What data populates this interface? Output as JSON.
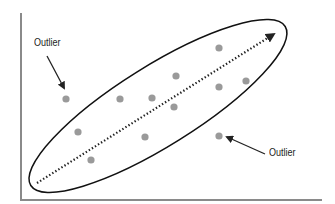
{
  "chart_data": {
    "type": "scatter",
    "title": "",
    "xlabel": "",
    "ylabel": "",
    "grid": false,
    "legend": null,
    "colors": {
      "points": "#9a9a9a",
      "axes": "#8a8a8a",
      "ellipse": "#111111",
      "trend": "#222222"
    },
    "points_px": [
      {
        "x": 66,
        "y": 99,
        "outlier": true
      },
      {
        "x": 120,
        "y": 99
      },
      {
        "x": 152,
        "y": 98
      },
      {
        "x": 176,
        "y": 76
      },
      {
        "x": 219,
        "y": 48
      },
      {
        "x": 174,
        "y": 107
      },
      {
        "x": 219,
        "y": 87
      },
      {
        "x": 246,
        "y": 81
      },
      {
        "x": 78,
        "y": 132
      },
      {
        "x": 145,
        "y": 137
      },
      {
        "x": 91,
        "y": 160
      },
      {
        "x": 219,
        "y": 136,
        "outlier": true
      }
    ],
    "trend_line": {
      "style": "dotted",
      "from": [
        37,
        183
      ],
      "to": [
        276,
        32
      ],
      "arrowhead": true
    },
    "ellipse": {
      "cx": 158,
      "cy": 106,
      "rx": 150,
      "ry": 40,
      "rotate": -32
    },
    "annotations": [
      {
        "text": "Outlier",
        "x": 35,
        "y": 38,
        "arrow_to": [
          63,
          90
        ]
      },
      {
        "text": "Outlier",
        "x": 269,
        "y": 147,
        "arrow_to": [
          225,
          136
        ]
      }
    ]
  }
}
